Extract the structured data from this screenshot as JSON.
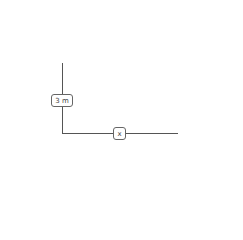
{
  "diagram": {
    "vertical_label": "3 m",
    "horizontal_label": "x",
    "colors": {
      "line": "#555555",
      "label_border": "#666666",
      "text": "#444444",
      "background": "#ffffff"
    }
  }
}
